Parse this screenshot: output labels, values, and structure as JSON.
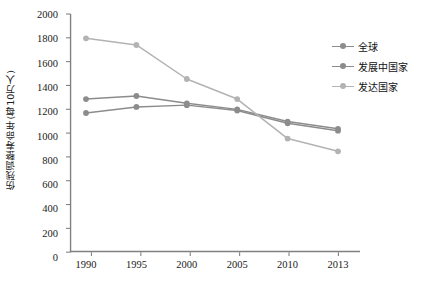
{
  "chart_data": {
    "type": "line",
    "title": "",
    "xlabel": "",
    "ylabel": "伤残调整寿命年(每10万人)",
    "categories": [
      "1990",
      "1995",
      "2000",
      "2005",
      "2010",
      "2013"
    ],
    "ylim": [
      0,
      2000
    ],
    "ytick_step": 200,
    "yticks": [
      "0",
      "200",
      "400",
      "600",
      "800",
      "1000",
      "1200",
      "1400",
      "1600",
      "1800",
      "2000"
    ],
    "grid": false,
    "legend_position": "right",
    "series": [
      {
        "name": "全球",
        "color": "#8c8c8c",
        "values": [
          1185,
          1235,
          1250,
          1205,
          1100,
          1040
        ]
      },
      {
        "name": "发展中国家",
        "color": "#8c8c8c",
        "values": [
          1300,
          1325,
          1265,
          1215,
          1115,
          1055
        ]
      },
      {
        "name": "发达国家",
        "color": "#b3b3b3",
        "values": [
          1800,
          1745,
          1465,
          1300,
          975,
          870
        ]
      }
    ]
  },
  "axis": {
    "line_color": "#808080"
  }
}
